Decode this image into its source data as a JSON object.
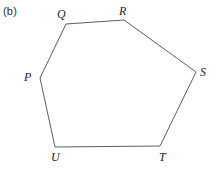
{
  "figure": {
    "part_label": "(b)",
    "caption": "",
    "background_color": "#ffffff",
    "stroke_color": "#4a4a52",
    "stroke_width": 0.9,
    "label_color": "#1c1c1c",
    "width": 216,
    "height": 171
  },
  "chart_data": {
    "type": "diagram",
    "shape": "hexagon",
    "title": "(b)",
    "closed": true,
    "vertices": [
      {
        "name": "P",
        "x": 40,
        "y": 78,
        "label_x": 24,
        "label_y": 71
      },
      {
        "name": "Q",
        "x": 66,
        "y": 24,
        "label_x": 57,
        "label_y": 8
      },
      {
        "name": "R",
        "x": 124,
        "y": 20,
        "label_x": 119,
        "label_y": 5
      },
      {
        "name": "S",
        "x": 196,
        "y": 72,
        "label_x": 200,
        "label_y": 66
      },
      {
        "name": "T",
        "x": 160,
        "y": 146,
        "label_x": 159,
        "label_y": 151
      },
      {
        "name": "U",
        "x": 55,
        "y": 147,
        "label_x": 51,
        "label_y": 151
      }
    ],
    "edges": [
      {
        "from": "P",
        "to": "Q"
      },
      {
        "from": "Q",
        "to": "R"
      },
      {
        "from": "R",
        "to": "S"
      },
      {
        "from": "S",
        "to": "T"
      },
      {
        "from": "T",
        "to": "U"
      },
      {
        "from": "U",
        "to": "P"
      }
    ]
  }
}
